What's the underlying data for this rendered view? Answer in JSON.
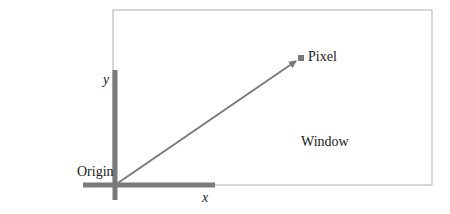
{
  "diagram": {
    "type": "coordinate-system",
    "colors": {
      "axis": "#7a7a7a",
      "window_border": "#b0b0b0",
      "vector": "#7a7a7a",
      "text": "#1a1a1a",
      "background": "#ffffff"
    },
    "labels": {
      "origin": "Origin",
      "x_axis": "x",
      "y_axis": "y",
      "pixel": "Pixel",
      "window": "Window"
    },
    "window_rect": {
      "x": 113,
      "y": 10,
      "width": 319,
      "height": 175
    },
    "origin_point": {
      "x": 115,
      "y": 185
    },
    "pixel_point": {
      "x": 301,
      "y": 58
    }
  }
}
